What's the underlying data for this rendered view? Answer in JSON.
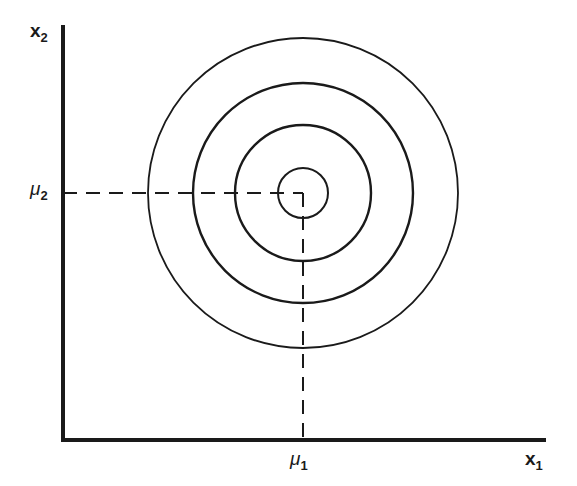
{
  "diagram": {
    "type": "contour-plot",
    "axes": {
      "x": {
        "symbol": "x",
        "subscript": "1"
      },
      "y": {
        "symbol": "x",
        "subscript": "2"
      }
    },
    "mean": {
      "x": {
        "symbol": "μ",
        "subscript": "1"
      },
      "y": {
        "symbol": "μ",
        "subscript": "2"
      }
    },
    "contours": {
      "count": 4,
      "shape": "circle",
      "center": [
        303,
        193
      ],
      "radii_px": [
        25,
        68,
        110,
        155
      ]
    },
    "colors": {
      "ink": "#1a1a1a",
      "background": "#ffffff"
    }
  }
}
